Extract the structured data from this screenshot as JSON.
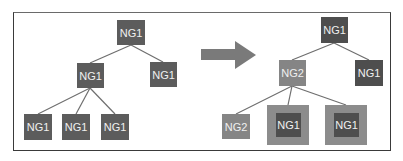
{
  "diagram": {
    "left_tree": {
      "root": {
        "label": "NG1"
      },
      "level1": [
        {
          "label": "NG1"
        },
        {
          "label": "NG1"
        }
      ],
      "level2": [
        {
          "label": "NG1"
        },
        {
          "label": "NG1"
        },
        {
          "label": "NG1"
        }
      ]
    },
    "arrow": {
      "direction": "right",
      "color": "#7a7a7a"
    },
    "right_tree": {
      "root": {
        "label": "NG1"
      },
      "level1": [
        {
          "label": "NG2"
        },
        {
          "label": "NG1"
        }
      ],
      "level2": [
        {
          "label": "NG2"
        },
        {
          "label": "NG1",
          "highlighted": true
        },
        {
          "label": "NG1",
          "highlighted": true
        }
      ]
    },
    "colors": {
      "ng1": "#5c5c5c",
      "ng2": "#858585",
      "highlight": "#8c8c8c"
    }
  }
}
